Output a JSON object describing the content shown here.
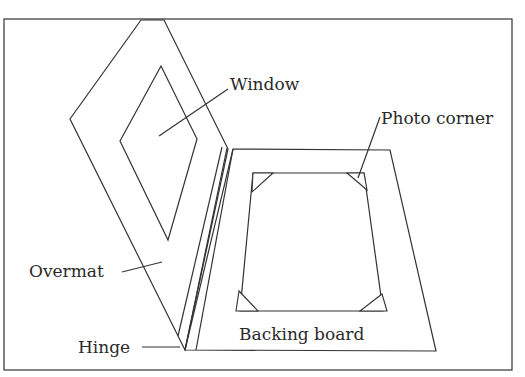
{
  "diagram": {
    "labels": {
      "window": "Window",
      "photo_corner": "Photo corner",
      "overmat": "Overmat",
      "backing_board": "Backing board",
      "hinge": "Hinge"
    },
    "colors": {
      "line": "#333333",
      "text": "#2a2a2a",
      "background": "#ffffff"
    }
  }
}
